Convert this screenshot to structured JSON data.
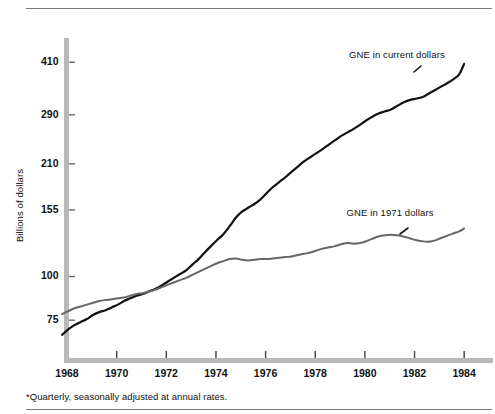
{
  "figure": {
    "footnote": "*Quarterly, seasonally adjusted at annual rates."
  },
  "chart_data": {
    "type": "line",
    "title": "",
    "subtitle": "",
    "xlabel": "",
    "ylabel": "Billions of dollars",
    "yscale": "log",
    "ylim": [
      62,
      440
    ],
    "xlim": [
      1967.6,
      1984.3
    ],
    "grid": false,
    "legend_position": "inline-right",
    "ytick_labels": [
      "410",
      "290",
      "210",
      "155",
      "100",
      "75"
    ],
    "ytick_values": [
      410,
      290,
      210,
      155,
      100,
      75
    ],
    "xtick_labels": [
      "1968",
      "1970",
      "1972",
      "1974",
      "1976",
      "1978",
      "1980",
      "1982",
      "1984"
    ],
    "xtick_values": [
      1968,
      1970,
      1972,
      1974,
      1976,
      1978,
      1980,
      1982,
      1984
    ],
    "annotations": [
      {
        "text": "GNE in current dollars",
        "x": 1981.3,
        "y": 430,
        "color": "#111111"
      },
      {
        "text": "GNE in 1971 dollars",
        "x": 1981.2,
        "y": 152,
        "color": "#111111"
      }
    ],
    "series": [
      {
        "name": "GNE in current dollars",
        "color": "#111111",
        "width": 2.2,
        "x": [
          1967.8,
          1968.05,
          1968.3,
          1968.55,
          1968.8,
          1969.05,
          1969.3,
          1969.55,
          1969.8,
          1970.05,
          1970.3,
          1970.55,
          1970.8,
          1971.05,
          1971.3,
          1971.55,
          1971.8,
          1972.05,
          1972.3,
          1972.55,
          1972.8,
          1973.05,
          1973.3,
          1973.55,
          1973.8,
          1974.05,
          1974.3,
          1974.55,
          1974.8,
          1975.05,
          1975.3,
          1975.55,
          1975.8,
          1976.05,
          1976.3,
          1976.55,
          1976.8,
          1977.05,
          1977.3,
          1977.55,
          1977.8,
          1978.05,
          1978.3,
          1978.55,
          1978.8,
          1979.05,
          1979.3,
          1979.55,
          1979.8,
          1980.05,
          1980.3,
          1980.55,
          1980.8,
          1981.05,
          1981.3,
          1981.55,
          1981.8,
          1982.05,
          1982.3,
          1982.55,
          1982.8,
          1983.05,
          1983.3,
          1983.55,
          1983.8,
          1984.0
        ],
        "y": [
          68.0,
          70.5,
          72.5,
          74.0,
          75.5,
          77.5,
          79.0,
          80.0,
          81.5,
          83.0,
          85.0,
          86.5,
          88.0,
          89.0,
          90.5,
          92.0,
          94.0,
          96.5,
          99.0,
          101.5,
          104.0,
          108.0,
          112.0,
          117.0,
          122.0,
          127.0,
          132.0,
          139.0,
          147.0,
          153.0,
          157.0,
          161.0,
          166.0,
          173.0,
          180.0,
          186.0,
          192.0,
          199.0,
          206.0,
          213.0,
          219.0,
          225.0,
          231.0,
          238.0,
          245.0,
          252.0,
          258.0,
          264.0,
          271.0,
          279.0,
          286.0,
          292.0,
          296.0,
          300.0,
          307.0,
          314.0,
          319.0,
          322.0,
          325.0,
          332.0,
          340.0,
          348.0,
          356.0,
          365.0,
          378.0,
          405.0
        ]
      },
      {
        "name": "GNE in 1971 dollars",
        "color": "#666666",
        "width": 2.0,
        "x": [
          1967.8,
          1968.05,
          1968.3,
          1968.55,
          1968.8,
          1969.05,
          1969.3,
          1969.55,
          1969.8,
          1970.05,
          1970.3,
          1970.55,
          1970.8,
          1971.05,
          1971.3,
          1971.55,
          1971.8,
          1972.05,
          1972.3,
          1972.55,
          1972.8,
          1973.05,
          1973.3,
          1973.55,
          1973.8,
          1974.05,
          1974.3,
          1974.55,
          1974.8,
          1975.05,
          1975.3,
          1975.55,
          1975.8,
          1976.05,
          1976.3,
          1976.55,
          1976.8,
          1977.05,
          1977.3,
          1977.55,
          1977.8,
          1978.05,
          1978.3,
          1978.55,
          1978.8,
          1979.05,
          1979.3,
          1979.55,
          1979.8,
          1980.05,
          1980.3,
          1980.55,
          1980.8,
          1981.05,
          1981.3,
          1981.55,
          1981.8,
          1982.05,
          1982.3,
          1982.55,
          1982.8,
          1983.05,
          1983.3,
          1983.55,
          1983.8,
          1984.0
        ],
        "y": [
          78.0,
          79.5,
          81.0,
          82.0,
          83.0,
          84.0,
          85.0,
          85.5,
          86.0,
          86.5,
          87.0,
          88.0,
          89.0,
          89.5,
          90.5,
          91.5,
          93.0,
          94.5,
          96.0,
          97.5,
          99.0,
          101.0,
          103.0,
          105.0,
          107.0,
          109.0,
          110.5,
          112.0,
          112.5,
          111.5,
          111.0,
          111.5,
          112.0,
          112.0,
          112.5,
          113.0,
          113.5,
          114.0,
          115.0,
          116.0,
          117.0,
          118.5,
          120.0,
          121.0,
          122.0,
          123.5,
          124.5,
          124.0,
          124.5,
          126.0,
          128.0,
          130.0,
          131.0,
          131.5,
          131.0,
          130.0,
          128.5,
          127.0,
          126.0,
          125.5,
          126.5,
          128.5,
          130.5,
          132.5,
          134.5,
          137.0
        ]
      }
    ]
  }
}
